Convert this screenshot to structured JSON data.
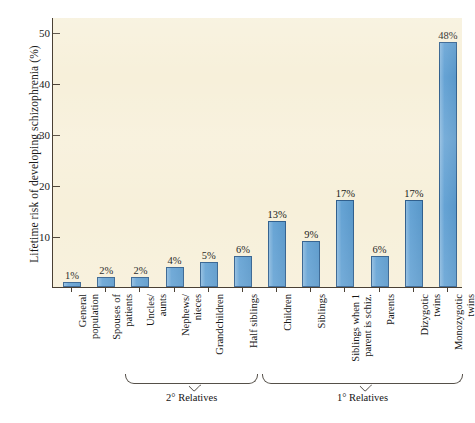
{
  "chart_data": {
    "type": "bar",
    "title": "",
    "xlabel": "",
    "ylabel": "Lifetime risk of developing schizophrenia (%)",
    "ylim": [
      0,
      53
    ],
    "yticks": [
      10,
      20,
      30,
      40,
      50
    ],
    "grid": false,
    "legend": null,
    "bar_color": "#5d9ed2",
    "bar_edge_color": "#2f5e8c",
    "plot_background": "#f7f0da",
    "categories": [
      "General population",
      "Spouses of patients",
      "Uncles/ aunts",
      "Nephews/ nieces",
      "Grandchildren",
      "Half siblings",
      "Children",
      "Siblings",
      "Siblings when 1 parent is schiz.",
      "Parents",
      "Dizygotic twins",
      "Monozygotic twins"
    ],
    "values": [
      1,
      2,
      2,
      4,
      5,
      6,
      13,
      9,
      17,
      6,
      17,
      48
    ],
    "value_labels": [
      "1%",
      "2%",
      "2%",
      "4%",
      "5%",
      "6%",
      "13%",
      "9%",
      "17%",
      "6%",
      "17%",
      "48%"
    ],
    "annotations": [
      {
        "label": "2° Relatives",
        "from_category": "Uncles/ aunts",
        "to_category": "Half siblings"
      },
      {
        "label": "1° Relatives",
        "from_category": "Children",
        "to_category": "Monozygotic twins"
      }
    ]
  },
  "axis": {
    "y_title": "Lifetime risk of developing schizophrenia (%)",
    "y_tick_labels": [
      "50",
      "40",
      "30",
      "20",
      "10"
    ]
  },
  "bars": [
    {
      "label": "General population",
      "label_lines": "General\npopulation",
      "value": 1,
      "value_label": "1%"
    },
    {
      "label": "Spouses of patients",
      "label_lines": "Spouses of\npatients",
      "value": 2,
      "value_label": "2%"
    },
    {
      "label": "Uncles/ aunts",
      "label_lines": "Uncles/\naunts",
      "value": 2,
      "value_label": "2%"
    },
    {
      "label": "Nephews/ nieces",
      "label_lines": "Nephews/\nnieces",
      "value": 4,
      "value_label": "4%"
    },
    {
      "label": "Grandchildren",
      "label_lines": "Grandchildren",
      "value": 5,
      "value_label": "5%"
    },
    {
      "label": "Half siblings",
      "label_lines": "Half siblings",
      "value": 6,
      "value_label": "6%"
    },
    {
      "label": "Children",
      "label_lines": "Children",
      "value": 13,
      "value_label": "13%"
    },
    {
      "label": "Siblings",
      "label_lines": "Siblings",
      "value": 9,
      "value_label": "9%"
    },
    {
      "label": "Siblings when 1 parent is schiz.",
      "label_lines": "Siblings when 1\nparent is schiz.",
      "value": 17,
      "value_label": "17%"
    },
    {
      "label": "Parents",
      "label_lines": "Parents",
      "value": 6,
      "value_label": "6%"
    },
    {
      "label": "Dizygotic twins",
      "label_lines": "Dizygotic\ntwins",
      "value": 17,
      "value_label": "17%"
    },
    {
      "label": "Monozygotic twins",
      "label_lines": "Monozygotic\ntwins",
      "value": 48,
      "value_label": "48%"
    }
  ],
  "brackets": [
    {
      "label": "2° Relatives"
    },
    {
      "label": "1° Relatives"
    }
  ]
}
